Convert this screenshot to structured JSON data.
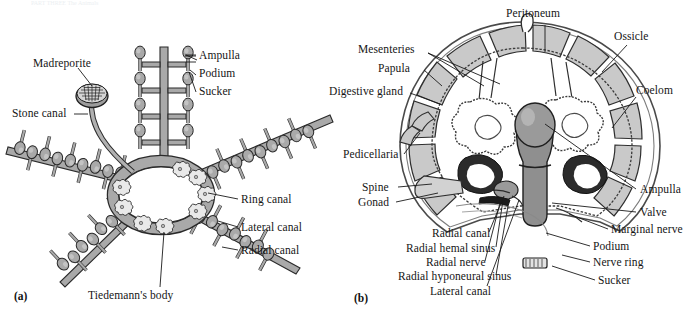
{
  "figure": {
    "header_remnant": "PART THREE The Animals",
    "panel_a_id": "(a)",
    "panel_b_id": "(b)"
  },
  "panel_a": {
    "caption": "Water vascular system of a sea star (aboral view)",
    "labels": [
      {
        "key": "madreporite",
        "text": "Madreporite",
        "x": 33,
        "y": 57
      },
      {
        "key": "stone_canal",
        "text": "Stone canal",
        "x": 12,
        "y": 111
      },
      {
        "key": "ampulla",
        "text": "Ampulla",
        "x": 188,
        "y": 53
      },
      {
        "key": "podium",
        "text": "Podium",
        "x": 188,
        "y": 71
      },
      {
        "key": "sucker",
        "text": "Sucker",
        "x": 188,
        "y": 89
      },
      {
        "key": "ring_canal",
        "text": "Ring canal",
        "x": 241,
        "y": 196
      },
      {
        "key": "lateral_canal",
        "text": "Lateral canal",
        "x": 241,
        "y": 224
      },
      {
        "key": "radial_canal",
        "text": "Radial canal",
        "x": 241,
        "y": 247
      },
      {
        "key": "tiedemanns_body",
        "text": "Tiedemann's body",
        "x": 88,
        "y": 292
      }
    ]
  },
  "panel_b": {
    "caption": "Cross section through a sea star arm",
    "labels": [
      {
        "key": "peritoneum",
        "text": "Peritoneum",
        "x": 505,
        "y": 10
      },
      {
        "key": "ossicle",
        "text": "Ossicle",
        "x": 614,
        "y": 33
      },
      {
        "key": "mesenteries",
        "text": "Mesenteries",
        "x": 379,
        "y": 46
      },
      {
        "key": "papula",
        "text": "Papula",
        "x": 384,
        "y": 65
      },
      {
        "key": "digestive_gland",
        "text": "Digestive gland",
        "x": 343,
        "y": 88
      },
      {
        "key": "coelom",
        "text": "Coelom",
        "x": 614,
        "y": 87
      },
      {
        "key": "pedicellaria",
        "text": "Pedicellaria",
        "x": 348,
        "y": 151
      },
      {
        "key": "spine",
        "text": "Spine",
        "x": 366,
        "y": 184
      },
      {
        "key": "gonad",
        "text": "Gonad",
        "x": 363,
        "y": 199
      },
      {
        "key": "ampulla",
        "text": "Ampulla",
        "x": 639,
        "y": 186
      },
      {
        "key": "valve",
        "text": "Valve",
        "x": 639,
        "y": 209
      },
      {
        "key": "marginal_nerve",
        "text": "Marginal nerve",
        "x": 611,
        "y": 226
      },
      {
        "key": "podium",
        "text": "Podium",
        "x": 593,
        "y": 243
      },
      {
        "key": "nerve_ring",
        "text": "Nerve ring",
        "x": 593,
        "y": 259
      },
      {
        "key": "sucker",
        "text": "Sucker",
        "x": 598,
        "y": 277
      },
      {
        "key": "radial_canal",
        "text": "Radial canal",
        "x": 432,
        "y": 230
      },
      {
        "key": "radial_hemal_sinus",
        "text": "Radial hemal sinus",
        "x": 406,
        "y": 245
      },
      {
        "key": "radial_nerve",
        "text": "Radial nerve",
        "x": 426,
        "y": 259
      },
      {
        "key": "radial_hyponeural_sinus",
        "text": "Radial hyponeural sinus",
        "x": 398,
        "y": 273
      },
      {
        "key": "lateral_canal",
        "text": "Lateral canal",
        "x": 430,
        "y": 288
      }
    ]
  },
  "colors": {
    "background": "#ffffff",
    "ink": "#151515",
    "canal_gray": "#a9a9a9",
    "canal_gray_dark": "#8f8f8f",
    "ossicle_gray": "#c9c9c9",
    "tissue_light": "#e6e6e6",
    "gonad_dark": "#2b2b2b",
    "podium_gray": "#9a9a9a",
    "leader_line": "#1a1a1a"
  }
}
